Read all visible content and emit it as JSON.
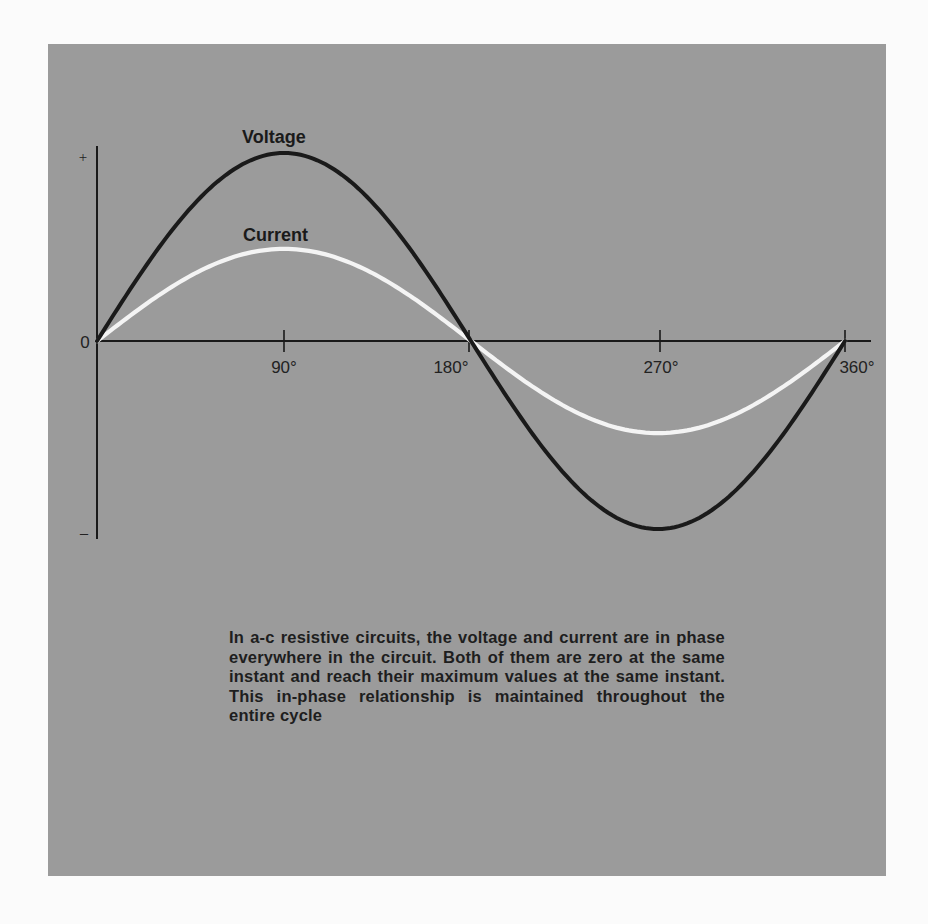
{
  "figure": {
    "background_color": "#9b9b9b",
    "page_color": "#fbfbfb",
    "caption": "In a-c resistive circuits, the voltage and current are in phase everywhere in the circuit. Both of them are zero at the same instant and reach their maximum values at the same instant. This in-phase relationship is maintained throughout the entire cycle"
  },
  "axes": {
    "y_plus_label": "+",
    "y_minus_label": "–",
    "origin_label": "0",
    "x_ticks": [
      {
        "deg": 90,
        "label": "90°"
      },
      {
        "deg": 180,
        "label": "180°"
      },
      {
        "deg": 270,
        "label": "270°"
      },
      {
        "deg": 360,
        "label": "360°"
      }
    ]
  },
  "curves": {
    "voltage": {
      "label": "Voltage",
      "amplitude": 1.0,
      "color": "#1a1a1a"
    },
    "current": {
      "label": "Current",
      "amplitude": 0.49,
      "color": "#f4f4f4"
    }
  },
  "chart_data": {
    "type": "line",
    "title": "",
    "xlabel": "Phase angle (degrees)",
    "ylabel": "",
    "x": [
      0,
      45,
      90,
      135,
      180,
      225,
      270,
      315,
      360
    ],
    "series": [
      {
        "name": "Voltage",
        "values": [
          0,
          0.71,
          1.0,
          0.71,
          0,
          -0.71,
          -1.0,
          -0.71,
          0
        ]
      },
      {
        "name": "Current",
        "values": [
          0,
          0.35,
          0.49,
          0.35,
          0,
          -0.35,
          -0.49,
          -0.35,
          0
        ]
      }
    ],
    "x_tick_labels": [
      "0",
      "90°",
      "180°",
      "270°",
      "360°"
    ],
    "y_tick_labels": [
      "+",
      "0",
      "–"
    ],
    "xlim": [
      0,
      360
    ],
    "ylim": [
      -1.03,
      1.03
    ],
    "grid": false,
    "legend": "inline labels above curves"
  }
}
